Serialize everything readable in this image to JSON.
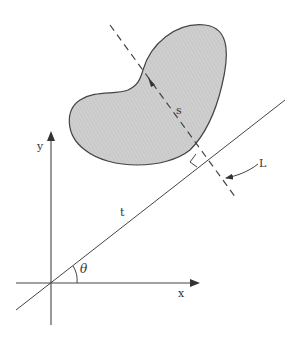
{
  "diagram": {
    "labels": {
      "x_axis": "x",
      "y_axis": "y",
      "line_t": "t",
      "angle": "θ",
      "distance": "s",
      "line_L": "L"
    },
    "colors": {
      "stroke": "#444444",
      "region_fill": "#c8c8c8",
      "background": "#ffffff"
    },
    "elements": [
      {
        "name": "x-axis",
        "from": [
          16,
          283
        ],
        "to": [
          198,
          283
        ],
        "arrow": "end"
      },
      {
        "name": "y-axis",
        "from": [
          51,
          325
        ],
        "to": [
          51,
          133
        ],
        "arrow": "end"
      },
      {
        "name": "line-t",
        "from": [
          16,
          310
        ],
        "to": [
          285,
          100
        ]
      },
      {
        "name": "line-L",
        "style": "dashed",
        "from": [
          110,
          25
        ],
        "to": [
          236,
          198
        ]
      },
      {
        "name": "kidney-region",
        "type": "shaded-blob"
      },
      {
        "name": "right-angle-marker",
        "at": [
          205,
          158
        ]
      },
      {
        "name": "angle-arc-theta",
        "center": [
          51,
          283
        ]
      }
    ]
  }
}
